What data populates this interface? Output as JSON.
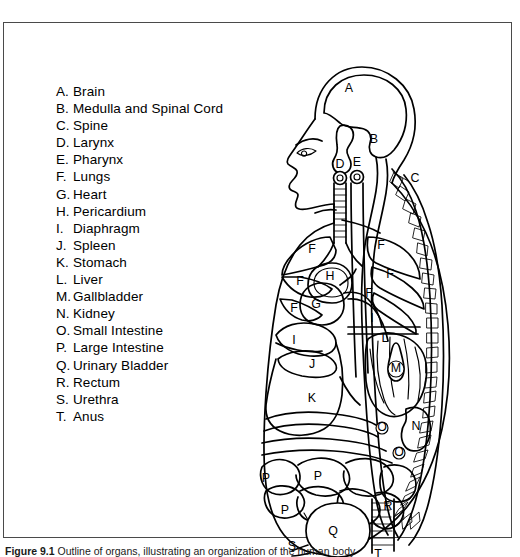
{
  "figure": {
    "caption_label": "Figure 9.1",
    "caption_text": "Outline of organs, illustrating an organization of the human body",
    "background_color": "#ffffff",
    "line_color": "#000000",
    "border_color": "#4a4a4a"
  },
  "legend": {
    "items": [
      {
        "key": "A.",
        "label": "Brain"
      },
      {
        "key": "B.",
        "label": "Medulla and Spinal Cord"
      },
      {
        "key": "C.",
        "label": "Spine"
      },
      {
        "key": "D.",
        "label": "Larynx"
      },
      {
        "key": "E.",
        "label": "Pharynx"
      },
      {
        "key": "F.",
        "label": "Lungs"
      },
      {
        "key": "G.",
        "label": "Heart"
      },
      {
        "key": "H.",
        "label": "Pericardium"
      },
      {
        "key": "I.",
        "label": "Diaphragm"
      },
      {
        "key": "J.",
        "label": "Spleen"
      },
      {
        "key": "K.",
        "label": "Stomach"
      },
      {
        "key": "L.",
        "label": "Liver"
      },
      {
        "key": "M.",
        "label": "Gallbladder"
      },
      {
        "key": "N.",
        "label": "Kidney"
      },
      {
        "key": "O.",
        "label": "Small Intestine"
      },
      {
        "key": "P.",
        "label": "Large Intestine"
      },
      {
        "key": "Q.",
        "label": "Urinary Bladder"
      },
      {
        "key": "R.",
        "label": "Rectum"
      },
      {
        "key": "S.",
        "label": "Urethra"
      },
      {
        "key": "T.",
        "label": "Anus"
      }
    ]
  },
  "diagram_markers": [
    {
      "id": "A",
      "organ": "Brain",
      "x": 97,
      "y": 42
    },
    {
      "id": "B",
      "organ": "Medulla and Spinal Cord",
      "x": 122,
      "y": 93
    },
    {
      "id": "C",
      "organ": "Spine",
      "x": 163,
      "y": 132
    },
    {
      "id": "D",
      "organ": "Larynx",
      "x": 88,
      "y": 118
    },
    {
      "id": "E",
      "organ": "Pharynx",
      "x": 103,
      "y": 116
    },
    {
      "id": "F1",
      "organ": "Lungs",
      "x": 60,
      "y": 203
    },
    {
      "id": "F2",
      "organ": "Lungs",
      "x": 129,
      "y": 199
    },
    {
      "id": "F3",
      "organ": "Lungs",
      "x": 48,
      "y": 235
    },
    {
      "id": "F4",
      "organ": "Lungs",
      "x": 138,
      "y": 228
    },
    {
      "id": "F5",
      "organ": "Lungs",
      "x": 42,
      "y": 262
    },
    {
      "id": "F6",
      "organ": "Lungs",
      "x": 117,
      "y": 247
    },
    {
      "id": "G",
      "organ": "Heart",
      "x": 64,
      "y": 258
    },
    {
      "id": "H",
      "organ": "Pericardium",
      "x": 78,
      "y": 230
    },
    {
      "id": "I1",
      "organ": "Diaphragm",
      "x": 42,
      "y": 294
    },
    {
      "id": "I2",
      "organ": "Diaphragm",
      "x": 120,
      "y": 272
    },
    {
      "id": "J",
      "organ": "Spleen",
      "x": 60,
      "y": 318
    },
    {
      "id": "K",
      "organ": "Stomach",
      "x": 60,
      "y": 352
    },
    {
      "id": "L",
      "organ": "Liver",
      "x": 133,
      "y": 292
    },
    {
      "id": "M",
      "organ": "Gallbladder",
      "x": 144,
      "y": 322
    },
    {
      "id": "N",
      "organ": "Kidney",
      "x": 164,
      "y": 380
    },
    {
      "id": "O1",
      "organ": "Small Intestine",
      "x": 130,
      "y": 381
    },
    {
      "id": "O2",
      "organ": "Small Intestine",
      "x": 147,
      "y": 406
    },
    {
      "id": "P1",
      "organ": "Large Intestine",
      "x": 14,
      "y": 432
    },
    {
      "id": "P2",
      "organ": "Large Intestine",
      "x": 66,
      "y": 430
    },
    {
      "id": "P3",
      "organ": "Large Intestine",
      "x": 33,
      "y": 464
    },
    {
      "id": "Q",
      "organ": "Urinary Bladder",
      "x": 81,
      "y": 485
    },
    {
      "id": "R",
      "organ": "Rectum",
      "x": 136,
      "y": 460
    },
    {
      "id": "S",
      "organ": "Urethra",
      "x": 40,
      "y": 500
    },
    {
      "id": "T",
      "organ": "Anus",
      "x": 126,
      "y": 508
    }
  ]
}
